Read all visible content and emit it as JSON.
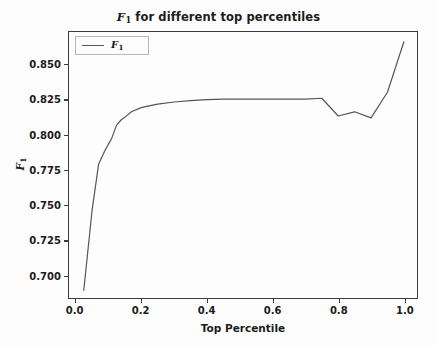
{
  "chart_data": {
    "type": "line",
    "title_prefix": "F",
    "title_sub": "1",
    "title_rest": " for different top percentiles",
    "xlabel": "Top Percentile",
    "ylabel_prefix": "F",
    "ylabel_sub": "1",
    "xlim": [
      -0.02,
      1.04
    ],
    "ylim": [
      0.6835,
      0.8735
    ],
    "xticks": [
      0.0,
      0.2,
      0.4,
      0.6,
      0.8,
      1.0
    ],
    "xtick_labels": [
      "0.0",
      "0.2",
      "0.4",
      "0.6",
      "0.8",
      "1.0"
    ],
    "yticks": [
      0.7,
      0.725,
      0.75,
      0.775,
      0.8,
      0.825,
      0.85
    ],
    "ytick_labels": [
      "0.700",
      "0.725",
      "0.750",
      "0.775",
      "0.800",
      "0.825",
      "0.850"
    ],
    "grid": false,
    "legend": {
      "position": "upper-left",
      "entries": [
        {
          "label_prefix": "F",
          "label_sub": "1",
          "color": "#555555"
        }
      ]
    },
    "series": [
      {
        "name": "F_1",
        "color": "#555555",
        "linewidth": 1.2,
        "x": [
          0.025,
          0.05,
          0.07,
          0.09,
          0.11,
          0.125,
          0.14,
          0.15,
          0.17,
          0.2,
          0.22,
          0.25,
          0.3,
          0.35,
          0.4,
          0.45,
          0.5,
          0.55,
          0.6,
          0.65,
          0.7,
          0.75,
          0.8,
          0.85,
          0.9,
          0.95,
          1.0
        ],
        "y": [
          0.689,
          0.7455,
          0.779,
          0.789,
          0.7975,
          0.807,
          0.811,
          0.8125,
          0.8165,
          0.8195,
          0.8205,
          0.822,
          0.8235,
          0.8245,
          0.8252,
          0.8256,
          0.8256,
          0.8255,
          0.8255,
          0.8255,
          0.8255,
          0.8262,
          0.8135,
          0.8165,
          0.8122,
          0.8305,
          0.8665
        ]
      }
    ],
    "annotations": [],
    "background_color": "#fdfdfd",
    "axis_color": "#3b3b3b",
    "text_color": "#1b1b1b"
  }
}
